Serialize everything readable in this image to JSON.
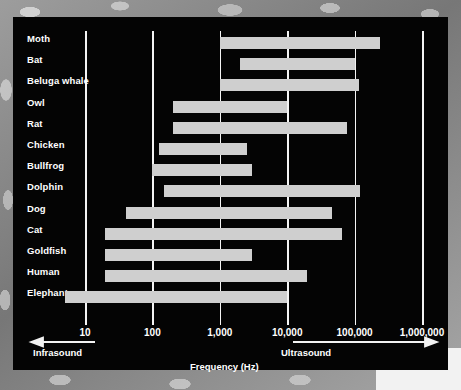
{
  "figure": {
    "title": "",
    "panel_bg": "#040404",
    "bar_color": "#cfcfcf",
    "grid_color": "#f4f4f4",
    "text_color": "#ffffff"
  },
  "axis": {
    "xlabel": "Frequency (Hz)",
    "tick_labels": [
      "10",
      "100",
      "1,000",
      "10,000",
      "100,000",
      "1,000,000"
    ],
    "tick_values": [
      10,
      100,
      1000,
      10000,
      100000,
      1000000
    ],
    "left_band_label": "Infrasound",
    "right_band_label": "Ultrasound"
  },
  "chart_data": {
    "type": "bar",
    "orientation": "horizontal-range",
    "title": "",
    "xlabel": "Frequency (Hz)",
    "ylabel": "",
    "xscale": "log",
    "xlim": [
      10,
      1000000
    ],
    "grid": true,
    "legend": "none",
    "annotations": [
      "Infrasound",
      "Ultrasound"
    ],
    "categories": [
      "Moth",
      "Bat",
      "Beluga whale",
      "Owl",
      "Rat",
      "Chicken",
      "Bullfrog",
      "Dolphin",
      "Dog",
      "Cat",
      "Goldfish",
      "Human",
      "Elephant"
    ],
    "series": [
      {
        "name": "Hearing range low (Hz)",
        "values": [
          1000,
          2000,
          1000,
          200,
          200,
          125,
          100,
          150,
          40,
          20,
          20,
          20,
          5
        ]
      },
      {
        "name": "Hearing range high (Hz)",
        "values": [
          240000,
          100000,
          115000,
          10000,
          76000,
          2500,
          3000,
          120000,
          46000,
          64000,
          3000,
          20000,
          10000
        ]
      }
    ],
    "rows": [
      {
        "label": "Moth",
        "low": 1000,
        "high": 240000
      },
      {
        "label": "Bat",
        "low": 2000,
        "high": 100000
      },
      {
        "label": "Beluga whale",
        "low": 1000,
        "high": 115000
      },
      {
        "label": "Owl",
        "low": 200,
        "high": 10000
      },
      {
        "label": "Rat",
        "low": 200,
        "high": 76000
      },
      {
        "label": "Chicken",
        "low": 125,
        "high": 2500
      },
      {
        "label": "Bullfrog",
        "low": 100,
        "high": 3000
      },
      {
        "label": "Dolphin",
        "low": 150,
        "high": 120000
      },
      {
        "label": "Dog",
        "low": 40,
        "high": 46000
      },
      {
        "label": "Cat",
        "low": 20,
        "high": 64000
      },
      {
        "label": "Goldfish",
        "low": 20,
        "high": 3000
      },
      {
        "label": "Human",
        "low": 20,
        "high": 20000
      },
      {
        "label": "Elephant",
        "low": 5,
        "high": 10000
      }
    ]
  }
}
